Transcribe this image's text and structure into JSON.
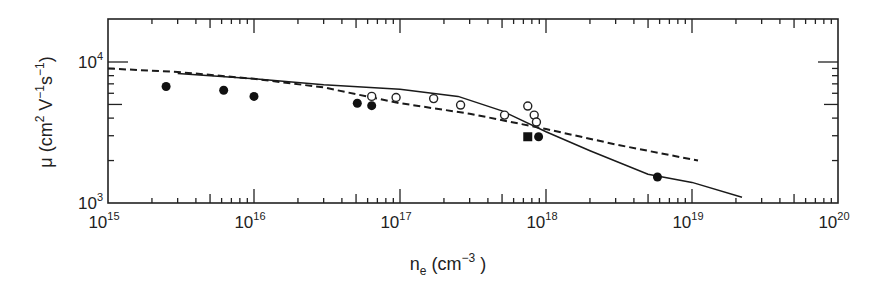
{
  "chart_data": {
    "type": "scatter",
    "title": "",
    "xlabel": "n_e (cm^-3)",
    "ylabel": "μ (cm^2 V^-1 s^-1)",
    "xscale": "log",
    "yscale": "log",
    "xlim": [
      1000000000000000.0,
      1e+20
    ],
    "ylim": [
      1000,
      20000
    ],
    "x_ticks": [
      "10^15",
      "10^16",
      "10^17",
      "10^18",
      "10^19",
      "10^20"
    ],
    "y_ticks": [
      "10^3",
      "10^4"
    ],
    "grid": false,
    "legend": null,
    "series": [
      {
        "name": "filled circles",
        "marker": "filled-circle",
        "points": [
          {
            "x": 2500000000000000.0,
            "y": 6700
          },
          {
            "x": 6200000000000000.0,
            "y": 6300
          },
          {
            "x": 1e+16,
            "y": 5700
          },
          {
            "x": 5.1e+16,
            "y": 5100
          },
          {
            "x": 6.4e+16,
            "y": 4900
          },
          {
            "x": 8.9e+17,
            "y": 2950
          },
          {
            "x": 5.8e+18,
            "y": 1530
          }
        ]
      },
      {
        "name": "open circles",
        "marker": "open-circle",
        "points": [
          {
            "x": 6.4e+16,
            "y": 5700
          },
          {
            "x": 9.4e+16,
            "y": 5600
          },
          {
            "x": 1.7e+17,
            "y": 5500
          },
          {
            "x": 2.6e+17,
            "y": 4950
          },
          {
            "x": 5.2e+17,
            "y": 4200
          },
          {
            "x": 7.5e+17,
            "y": 4870
          },
          {
            "x": 8.3e+17,
            "y": 4200
          },
          {
            "x": 8.6e+17,
            "y": 3750
          }
        ]
      },
      {
        "name": "filled square",
        "marker": "filled-square",
        "points": [
          {
            "x": 7.5e+17,
            "y": 2950
          }
        ]
      },
      {
        "name": "solid curve",
        "line": "solid",
        "points": [
          {
            "x": 3000000000000000.0,
            "y": 8300
          },
          {
            "x": 1e+16,
            "y": 7600
          },
          {
            "x": 3e+16,
            "y": 6900
          },
          {
            "x": 1e+17,
            "y": 6400
          },
          {
            "x": 2.5e+17,
            "y": 5700
          },
          {
            "x": 5e+17,
            "y": 4500
          },
          {
            "x": 1e+18,
            "y": 3200
          },
          {
            "x": 2e+18,
            "y": 2350
          },
          {
            "x": 5e+18,
            "y": 1600
          },
          {
            "x": 1e+19,
            "y": 1400
          },
          {
            "x": 2.2e+19,
            "y": 1100
          }
        ]
      },
      {
        "name": "dashed curve",
        "line": "dashed",
        "points": [
          {
            "x": 1000000000000000.0,
            "y": 9000
          },
          {
            "x": 3000000000000000.0,
            "y": 8500
          },
          {
            "x": 1e+16,
            "y": 7600
          },
          {
            "x": 3e+16,
            "y": 6600
          },
          {
            "x": 6.4e+16,
            "y": 5600
          },
          {
            "x": 1e+17,
            "y": 5100
          },
          {
            "x": 3e+17,
            "y": 4300
          },
          {
            "x": 1e+18,
            "y": 3350
          },
          {
            "x": 3e+18,
            "y": 2600
          },
          {
            "x": 1.1e+19,
            "y": 2000
          }
        ]
      }
    ]
  },
  "axes": {
    "x_title_main": "n",
    "x_title_sub": "e",
    "x_title_rest": " (cm",
    "x_title_sup": "−3",
    "x_title_end": " )",
    "y_title_prefix": "μ (cm",
    "y_sup1": "2",
    "y_mid1": " V",
    "y_sup2": "−1",
    "y_mid2": "s",
    "y_sup3": "−1",
    "y_end": ")",
    "x_tick_base": "10",
    "x_tick_exps": [
      "15",
      "16",
      "17",
      "18",
      "19",
      "20"
    ],
    "y_tick_base": "10",
    "y_tick_exps": [
      "3",
      "4"
    ]
  }
}
